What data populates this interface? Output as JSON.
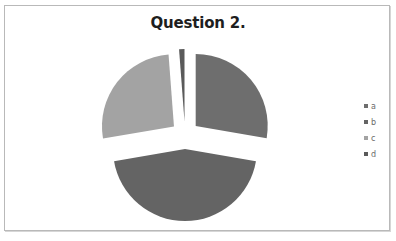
{
  "chart_data": {
    "type": "pie",
    "title": "Question 2.",
    "exploded": true,
    "categories": [
      "a",
      "b",
      "c",
      "d"
    ],
    "values": [
      27.7,
      44.6,
      26.5,
      1.2
    ],
    "unit": "percent (estimated from slice angles)",
    "colors": [
      "#6e6e6e",
      "#646464",
      "#a3a3a3",
      "#5a5a5a"
    ],
    "start_angle_deg": 0,
    "direction": "clockwise",
    "legend": {
      "position": "right",
      "entries": [
        "a",
        "b",
        "c",
        "d"
      ]
    },
    "data_labels": false
  },
  "legend": {
    "items": [
      {
        "label": "a",
        "color": "#6e6e6e"
      },
      {
        "label": "b",
        "color": "#646464"
      },
      {
        "label": "c",
        "color": "#a3a3a3"
      },
      {
        "label": "d",
        "color": "#5a5a5a"
      }
    ]
  }
}
